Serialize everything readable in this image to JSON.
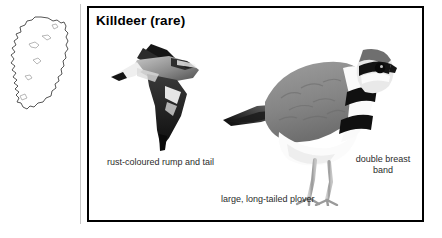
{
  "page": {
    "background_color": "#ffffff",
    "panel_border_color": "#000000"
  },
  "map": {
    "name": "ireland-distribution-map",
    "outline_color": "#555555",
    "fill_color": "#ffffff"
  },
  "panel": {
    "title": "Killdeer (rare)",
    "species": "Killdeer",
    "status": "rare"
  },
  "illustrations": [
    {
      "name": "killdeer-in-flight",
      "pose": "flying",
      "colors": {
        "wing_dark": "#1a1a1a",
        "body_grey": "#8e8e8e",
        "highlight": "#f2f2f2"
      }
    },
    {
      "name": "killdeer-standing",
      "pose": "standing",
      "colors": {
        "back_grey": "#8d8d8d",
        "belly_white": "#fbfbfb",
        "band_black": "#111111",
        "leg_grey": "#a8a8a8"
      }
    }
  ],
  "captions": {
    "rump": "rust-coloured rump and tail",
    "plover": "large, long-tailed plover",
    "breast_band": "double breast band"
  }
}
